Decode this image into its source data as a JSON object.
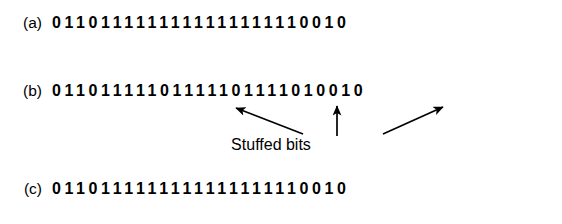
{
  "figure": {
    "rows": [
      {
        "label": "(a)",
        "name": "original-data-row",
        "bits": "0110111111111111111110010"
      },
      {
        "label": "(b)",
        "name": "stuffed-data-row",
        "bits": "01101111101111101111010010"
      },
      {
        "label": "(c)",
        "name": "destuffed-data-row",
        "bits": "0110111111111111111110010"
      }
    ],
    "annotation": {
      "stuffed_bits_label": "Stuffed bits",
      "arrow_count": 3
    },
    "colors": {
      "background": "#ffffff",
      "ink": "#000000"
    }
  }
}
